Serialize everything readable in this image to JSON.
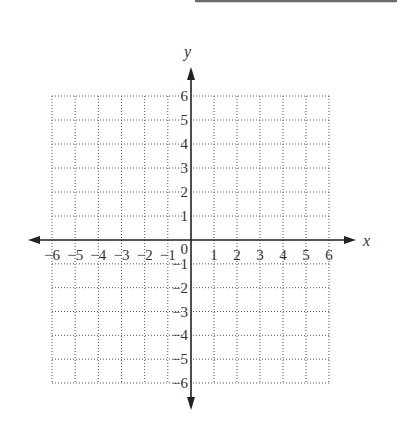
{
  "page": {
    "answer_line": {
      "visible": true,
      "color": "#6b6b6b"
    }
  },
  "chart_data": {
    "type": "scatter",
    "title": "",
    "xlabel": "x",
    "ylabel": "y",
    "xlim": [
      -6,
      6
    ],
    "ylim": [
      -6,
      6
    ],
    "grid": true,
    "grid_style": "dotted",
    "x_ticks": [
      -6,
      -5,
      -4,
      -3,
      -2,
      -1,
      1,
      2,
      3,
      4,
      5,
      6
    ],
    "y_ticks": [
      -6,
      -5,
      -4,
      -3,
      -2,
      -1,
      1,
      2,
      3,
      4,
      5,
      6
    ],
    "x_tick_labels": [
      "−6",
      "−5",
      "−4",
      "−3",
      "−2",
      "−1",
      "1",
      "2",
      "3",
      "4",
      "5",
      "6"
    ],
    "y_tick_labels": [
      "−6",
      "−5",
      "−4",
      "−3",
      "−2",
      "−1",
      "1",
      "2",
      "3",
      "4",
      "5",
      "6"
    ],
    "origin_label": "0",
    "series": [],
    "colors": {
      "axis": "#222222",
      "grid": "#555555",
      "text": "#333333"
    }
  }
}
